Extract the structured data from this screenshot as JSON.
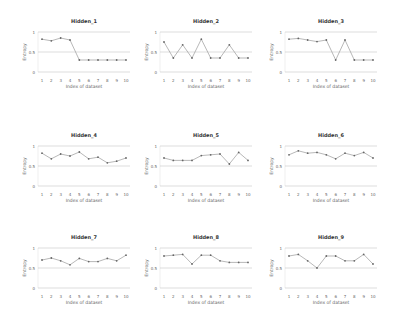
{
  "chart_data": [
    {
      "type": "line",
      "title": "Hidden_1",
      "xlabel": "Index of dataset",
      "ylabel": "Entropy",
      "x": [
        1,
        2,
        3,
        4,
        5,
        6,
        7,
        8,
        9,
        10
      ],
      "values": [
        0.82,
        0.78,
        0.85,
        0.8,
        0.3,
        0.3,
        0.3,
        0.3,
        0.3,
        0.3
      ],
      "ylim": [
        0,
        1
      ],
      "yticks": [
        "0",
        "0.5",
        "1"
      ],
      "grid": true
    },
    {
      "type": "line",
      "title": "Hidden_2",
      "xlabel": "Index of dataset",
      "ylabel": "Entropy",
      "x": [
        1,
        2,
        3,
        4,
        5,
        6,
        7,
        8,
        9,
        10
      ],
      "values": [
        0.75,
        0.35,
        0.68,
        0.35,
        0.82,
        0.35,
        0.35,
        0.68,
        0.35,
        0.35
      ],
      "ylim": [
        0,
        1
      ],
      "yticks": [
        "0",
        "0.5",
        "1"
      ],
      "grid": true
    },
    {
      "type": "line",
      "title": "Hidden_3",
      "xlabel": "Index of dataset",
      "ylabel": "Entropy",
      "x": [
        1,
        2,
        3,
        4,
        5,
        6,
        7,
        8,
        9,
        10
      ],
      "values": [
        0.82,
        0.84,
        0.8,
        0.76,
        0.8,
        0.3,
        0.8,
        0.3,
        0.3,
        0.3
      ],
      "ylim": [
        0,
        1
      ],
      "yticks": [
        "0",
        "0.5",
        "1"
      ],
      "grid": true
    },
    {
      "type": "line",
      "title": "Hidden_4",
      "xlabel": "Index of dataset",
      "ylabel": "Entropy",
      "x": [
        1,
        2,
        3,
        4,
        5,
        6,
        7,
        8,
        9,
        10
      ],
      "values": [
        0.82,
        0.68,
        0.8,
        0.75,
        0.85,
        0.68,
        0.72,
        0.58,
        0.62,
        0.7
      ],
      "ylim": [
        0,
        1
      ],
      "yticks": [
        "0",
        "0.5",
        "1"
      ],
      "grid": true
    },
    {
      "type": "line",
      "title": "Hidden_5",
      "xlabel": "Index of dataset",
      "ylabel": "Entropy",
      "x": [
        1,
        2,
        3,
        4,
        5,
        6,
        7,
        8,
        9,
        10
      ],
      "values": [
        0.7,
        0.64,
        0.64,
        0.64,
        0.76,
        0.78,
        0.8,
        0.55,
        0.84,
        0.64
      ],
      "ylim": [
        0,
        1
      ],
      "yticks": [
        "0",
        "0.5",
        "1"
      ],
      "grid": true
    },
    {
      "type": "line",
      "title": "Hidden_6",
      "xlabel": "Index of dataset",
      "ylabel": "Entropy",
      "x": [
        1,
        2,
        3,
        4,
        5,
        6,
        7,
        8,
        9,
        10
      ],
      "values": [
        0.78,
        0.88,
        0.82,
        0.84,
        0.78,
        0.68,
        0.82,
        0.76,
        0.84,
        0.7
      ],
      "ylim": [
        0,
        1
      ],
      "yticks": [
        "0",
        "0.5",
        "1"
      ],
      "grid": true
    },
    {
      "type": "line",
      "title": "Hidden_7",
      "xlabel": "Index of dataset",
      "ylabel": "Entropy",
      "x": [
        1,
        2,
        3,
        4,
        5,
        6,
        7,
        8,
        9,
        10
      ],
      "values": [
        0.7,
        0.75,
        0.68,
        0.58,
        0.74,
        0.66,
        0.66,
        0.74,
        0.68,
        0.82
      ],
      "ylim": [
        0,
        1
      ],
      "yticks": [
        "0",
        "0.5",
        "1"
      ],
      "grid": true
    },
    {
      "type": "line",
      "title": "Hidden_8",
      "xlabel": "Index of dataset",
      "ylabel": "Entropy",
      "x": [
        1,
        2,
        3,
        4,
        5,
        6,
        7,
        8,
        9,
        10
      ],
      "values": [
        0.8,
        0.82,
        0.84,
        0.6,
        0.82,
        0.82,
        0.68,
        0.64,
        0.64,
        0.64
      ],
      "ylim": [
        0,
        1
      ],
      "yticks": [
        "0",
        "0.5",
        "1"
      ],
      "grid": true
    },
    {
      "type": "line",
      "title": "Hidden_9",
      "xlabel": "Index of dataset",
      "ylabel": "Entropy",
      "x": [
        1,
        2,
        3,
        4,
        5,
        6,
        7,
        8,
        9,
        10
      ],
      "values": [
        0.8,
        0.84,
        0.68,
        0.5,
        0.8,
        0.8,
        0.68,
        0.68,
        0.84,
        0.6
      ],
      "ylim": [
        0,
        1
      ],
      "yticks": [
        "0",
        "0.5",
        "1"
      ],
      "grid": true
    }
  ],
  "layout": {
    "columns_left": [
      38,
      160,
      285
    ],
    "plot_width": 92,
    "rows_top": [
      32,
      146,
      248
    ],
    "plot_height": 40
  }
}
